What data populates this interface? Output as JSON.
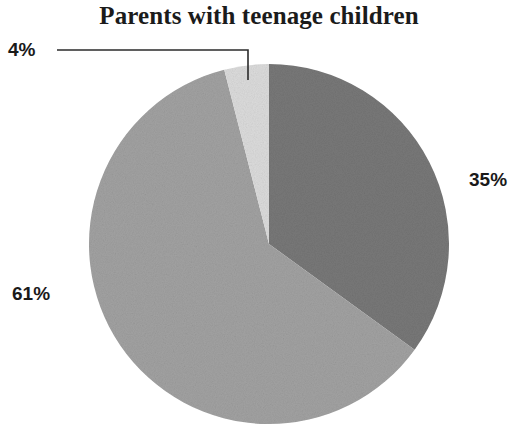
{
  "chart_data": {
    "type": "pie",
    "title": "Parents with teenage children",
    "xlabel": "",
    "ylabel": "",
    "legend_position": "none",
    "grid": false,
    "labels": [
      "35%",
      "61%",
      "4%"
    ],
    "values": [
      35,
      61,
      4
    ],
    "categories": [
      "Segment A",
      "Segment B",
      "Segment C"
    ],
    "slices": [
      {
        "label": "35%",
        "value": 35,
        "color": "#787878",
        "start_angle_deg": 0,
        "end_angle_deg": 126,
        "label_position": "right-outside",
        "has_leader_line": false
      },
      {
        "label": "61%",
        "value": 61,
        "color": "#a2a2a2",
        "start_angle_deg": 126,
        "end_angle_deg": 345.6,
        "label_position": "left-outside",
        "has_leader_line": false
      },
      {
        "label": "4%",
        "value": 4,
        "color": "#dcdcdc",
        "start_angle_deg": 345.6,
        "end_angle_deg": 360,
        "label_position": "top-left-outside",
        "has_leader_line": true
      }
    ],
    "total": 100,
    "units": "percent",
    "start_angle_note": "first slice begins at 12 o'clock, drawn clockwise"
  },
  "chart": {
    "title": "Parents with teenage children",
    "label_4": "4%",
    "label_61": "61%",
    "label_35": "35%"
  },
  "colors": {
    "slice_dark": "#787878",
    "slice_medium": "#a2a2a2",
    "slice_light": "#dcdcdc",
    "leader_line": "#2b2b2b",
    "text": "#1a1a1a",
    "background": "#ffffff"
  }
}
